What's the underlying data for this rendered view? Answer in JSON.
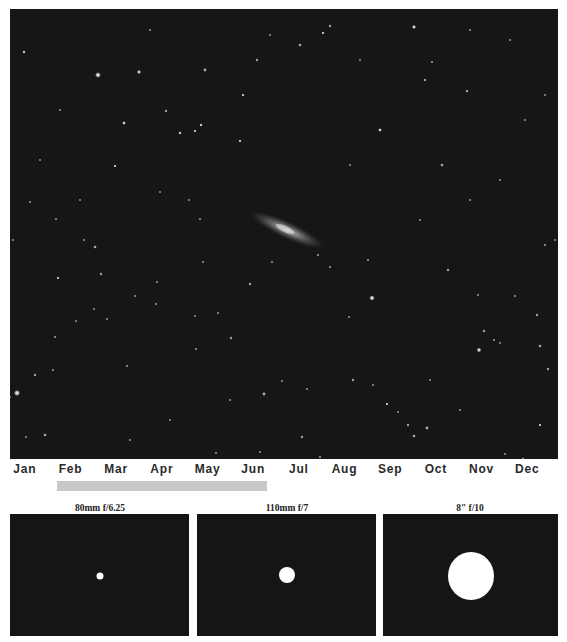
{
  "figure": {
    "sky_background": "#161616"
  },
  "months": [
    "Jan",
    "Feb",
    "Mar",
    "Apr",
    "May",
    "Jun",
    "Jul",
    "Aug",
    "Sep",
    "Oct",
    "Nov",
    "Dec"
  ],
  "visibility": {
    "start_month": "Feb",
    "end_month": "Jun",
    "bar_color": "#c8c8c8"
  },
  "scopes": [
    {
      "label": "80mm f/6.25",
      "relative_size": 1.0
    },
    {
      "label": "110mm f/7",
      "relative_size": 2.4
    },
    {
      "label": "8\" f/10",
      "relative_size": 7.0
    }
  ]
}
